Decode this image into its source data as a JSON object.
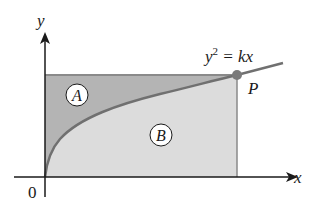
{
  "figure": {
    "axes": {
      "x_label": "x",
      "y_label": "y",
      "origin_label": "0"
    },
    "curve": {
      "equation_base": "y",
      "equation_exp": "2",
      "equation_rest": " = kx",
      "color": "#707070"
    },
    "point": {
      "label": "P",
      "color": "#7a7a7a"
    },
    "regions": [
      {
        "label": "A",
        "fill": "#b4b4b4",
        "description": "region between curve and y-axis, below top of rectangle"
      },
      {
        "label": "B",
        "fill": "#dcdcdc",
        "description": "region under curve, above x-axis"
      }
    ]
  }
}
